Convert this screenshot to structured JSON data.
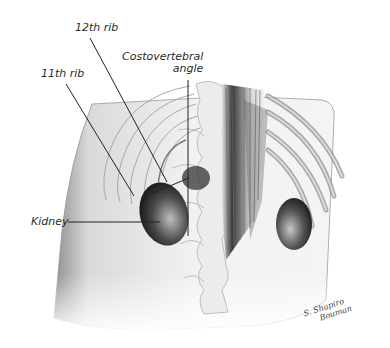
{
  "figure": {
    "labels": {
      "rib12": "12th rib",
      "rib11": "11th rib",
      "cva_line1": "Costovertebral",
      "cva_line2": "angle",
      "kidney": "Kidney"
    },
    "signature": {
      "line1": "S. Shapiro",
      "line2": "Bouman"
    }
  }
}
